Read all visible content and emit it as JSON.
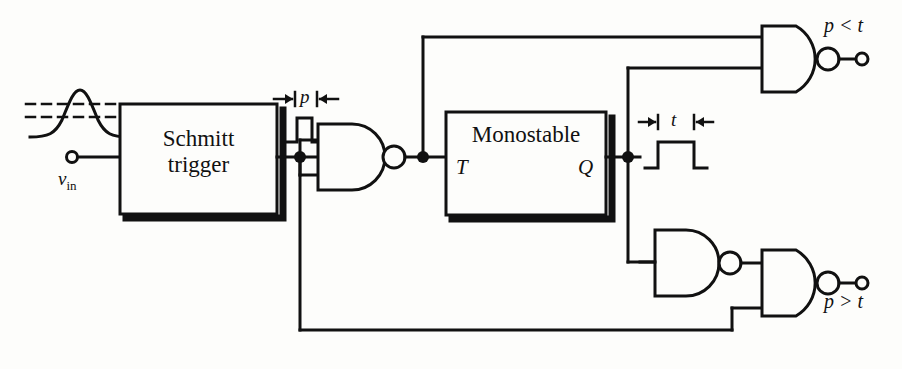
{
  "figure": {
    "type": "schematic-diagram",
    "stroke_color": "#111111",
    "background_color": "#fdfdfb",
    "line_width": 3
  },
  "blocks": [
    {
      "name": "schmitt-trigger",
      "label_line1": "Schmitt",
      "label_line2": "trigger",
      "x": 120,
      "y": 104,
      "w": 157,
      "h": 110
    },
    {
      "name": "monostable",
      "label_line1": "Monostable",
      "label_line2": "",
      "x": 446,
      "y": 112,
      "w": 160,
      "h": 103,
      "pins": [
        {
          "name": "T",
          "label": "T",
          "side": "left"
        },
        {
          "name": "Q",
          "label": "Q",
          "side": "right"
        }
      ]
    }
  ],
  "pins": {
    "monostable_t": "T",
    "monostable_q": "Q"
  },
  "terminals": [
    {
      "name": "vin-terminal",
      "label": "v",
      "sub": "in",
      "x": 72,
      "y": 157
    },
    {
      "name": "p-less-than-t-terminal",
      "label": "p < t",
      "x": 862,
      "y": 59
    },
    {
      "name": "p-greater-than-t-terminal",
      "label": "p > t",
      "x": 862,
      "y": 283
    }
  ],
  "labels": {
    "vin": "v",
    "vin_sub": "in",
    "pulse_p": "p",
    "pulse_t": "t",
    "out_top": "p < t",
    "out_bottom": "p > t"
  },
  "waveforms": [
    {
      "name": "input-bell-curve",
      "description": "gaussian pulse with two dashed hysteresis threshold lines"
    },
    {
      "name": "narrow-pulse-p",
      "description": "narrow rectangular pulse, width labelled p"
    },
    {
      "name": "wide-pulse-t",
      "description": "wide rectangular pulse, width labelled t"
    }
  ],
  "gates": [
    {
      "name": "nand-gate-1",
      "type": "NAND",
      "x": 318,
      "y": 124,
      "inputs_tied": true
    },
    {
      "name": "nand-gate-top",
      "type": "NAND",
      "x": 762,
      "y": 26,
      "inputs_tied": false
    },
    {
      "name": "nand-gate-3",
      "type": "NAND",
      "x": 655,
      "y": 230,
      "inputs_tied": true
    },
    {
      "name": "nand-gate-4",
      "type": "NAND",
      "x": 762,
      "y": 250,
      "inputs_tied": false
    }
  ],
  "junctions": [
    {
      "name": "schmitt-output-node",
      "x": 300,
      "y": 157
    },
    {
      "name": "nand1-output-node",
      "x": 423,
      "y": 157
    },
    {
      "name": "monostable-q-node",
      "x": 628,
      "y": 157
    }
  ]
}
